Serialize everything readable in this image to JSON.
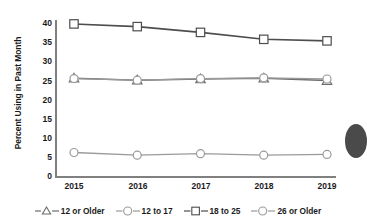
{
  "chart_data": {
    "type": "line",
    "title": "",
    "xlabel": "",
    "ylabel": "Percent Using in Past Month",
    "categories": [
      "2015",
      "2016",
      "2017",
      "2018",
      "2019"
    ],
    "x": [
      2015,
      2016,
      2017,
      2018,
      2019
    ],
    "ylim": [
      0,
      40
    ],
    "yticks": [
      0,
      5,
      10,
      15,
      20,
      25,
      30,
      35,
      40
    ],
    "grid": false,
    "legend_position": "bottom",
    "series": [
      {
        "name": "12 or Older",
        "marker": "triangle",
        "values": [
          25.4,
          24.9,
          25.2,
          25.4,
          24.8
        ]
      },
      {
        "name": "12 to 17",
        "marker": "circle",
        "values": [
          6.1,
          5.4,
          5.8,
          5.4,
          5.6
        ]
      },
      {
        "name": "18 to 25",
        "marker": "square",
        "values": [
          39.5,
          38.8,
          37.3,
          35.5,
          35.1
        ]
      },
      {
        "name": "26 or Older",
        "marker": "circle",
        "values": [
          25.3,
          24.9,
          25.3,
          25.5,
          25.2
        ]
      }
    ]
  },
  "axis": {
    "y_title": "Percent Using in Past Month",
    "y_tick_labels": [
      "40",
      "35",
      "30",
      "25",
      "20",
      "15",
      "10",
      "5",
      "0"
    ],
    "x_tick_labels": [
      "2015",
      "2016",
      "2017",
      "2018",
      "2019"
    ]
  },
  "legend": {
    "items": [
      {
        "label": "12 or Older",
        "marker": "triangle-marker"
      },
      {
        "label": "12 to 17",
        "marker": "circle-marker"
      },
      {
        "label": "18 to 25",
        "marker": "square-marker"
      },
      {
        "label": "26 or Older",
        "marker": "circle-marker"
      }
    ]
  },
  "colors": {
    "line_dark": "#4d4d4d",
    "line_mid": "#6b6b6b",
    "line_light": "#9a9a9a",
    "axis": "#808080",
    "text": "#1a1a1a",
    "marker_fill": "#ffffff"
  }
}
